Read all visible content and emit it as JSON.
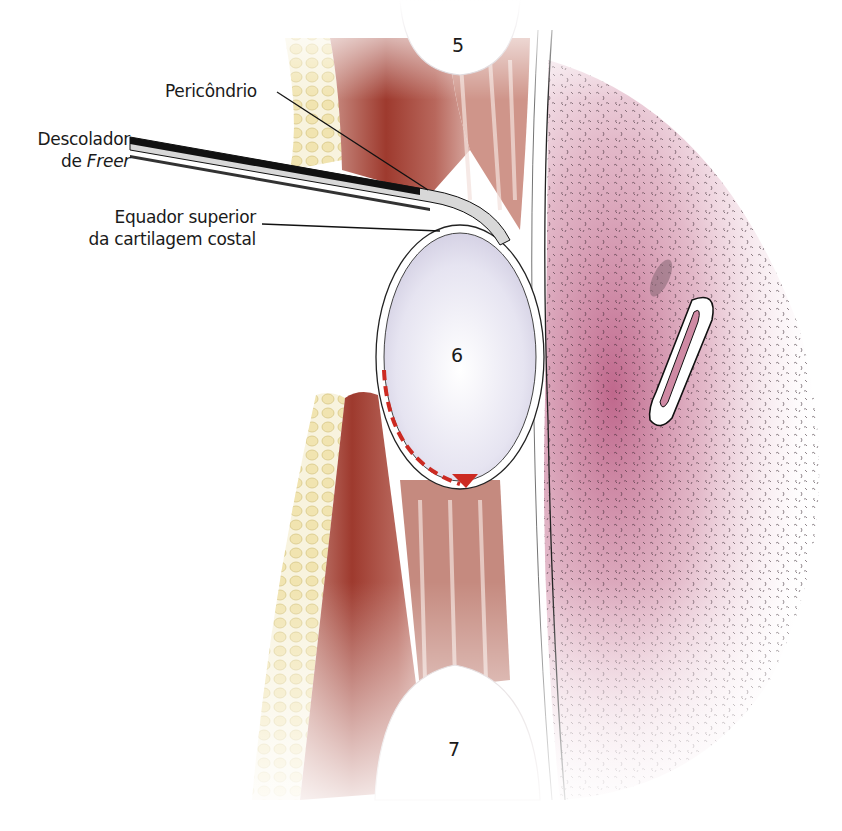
{
  "figure": {
    "type": "anatomical-surgical-illustration",
    "labels": {
      "perichondrium": "Pericôndrio",
      "elevator_line1": "Descolador",
      "elevator_line2_prefix": "de ",
      "elevator_line2_italic": "Freer",
      "equator_line1": "Equador superior",
      "equator_line2": "da cartilagem costal"
    },
    "rib_numbers": {
      "upper": "5",
      "middle": "6",
      "lower": "7"
    },
    "colors": {
      "fat": "#ecdca0",
      "muscle": "#a8403a",
      "cartilage": "#e4e2f0",
      "lung": "#c7708f",
      "perichondrium_incision": "#cc2a22",
      "instrument": "#1c1c1c"
    }
  }
}
